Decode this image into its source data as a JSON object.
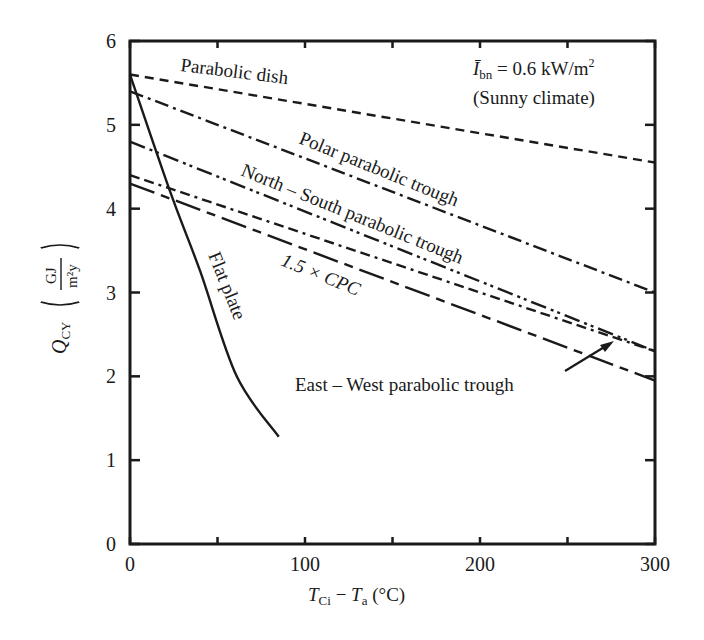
{
  "chart_data": {
    "type": "line",
    "title": "",
    "annotation": {
      "line1_symbol": "Ī",
      "line1_sub": "bn",
      "line1_rest": " = 0.6 kW/m",
      "line1_sup": "2",
      "line2": "(Sunny climate)"
    },
    "xlabel": {
      "T1": "T",
      "sub1": "Ci",
      "dash": " − ",
      "T2": "T",
      "sub2": "a",
      "unit": " (°C)"
    },
    "ylabel": {
      "Q": "Q",
      "sub": "CY",
      "num": "GJ",
      "den": "m²y"
    },
    "xlim": [
      0,
      300
    ],
    "ylim": [
      0,
      6
    ],
    "x_ticks": [
      0,
      100,
      200,
      300
    ],
    "x_minor_ticks": [
      50,
      150,
      250
    ],
    "y_ticks": [
      0,
      1,
      2,
      3,
      4,
      5,
      6
    ],
    "grid": false,
    "legend": "inline labels",
    "series": [
      {
        "name": "Parabolic dish",
        "style": "dashed",
        "x": [
          0,
          300
        ],
        "y": [
          5.6,
          4.55
        ]
      },
      {
        "name": "Polar parabolic trough",
        "style": "dash-dot",
        "x": [
          0,
          300
        ],
        "y": [
          5.4,
          3.0
        ]
      },
      {
        "name": "North – South parabolic trough",
        "style": "dash-dot-dot",
        "x": [
          0,
          300
        ],
        "y": [
          4.8,
          2.3
        ]
      },
      {
        "name": "1.5 × CPC",
        "style": "dash-dash-dot",
        "x": [
          0,
          300
        ],
        "y": [
          4.4,
          2.3
        ]
      },
      {
        "name": "East – West parabolic trough",
        "style": "long-dash-short-dash",
        "x": [
          0,
          300
        ],
        "y": [
          4.3,
          1.95
        ]
      },
      {
        "name": "Flat plate",
        "style": "solid",
        "x": [
          0,
          23,
          40,
          61,
          85
        ],
        "y": [
          5.6,
          4.2,
          3.26,
          2.0,
          1.28
        ]
      }
    ],
    "labels": {
      "dish": "Parabolic dish",
      "polar": "Polar parabolic trough",
      "ns": "North – South parabolic trough",
      "cpc": "1.5 × CPC",
      "ew": "East – West  parabolic trough",
      "flat": "Flat plate"
    }
  }
}
